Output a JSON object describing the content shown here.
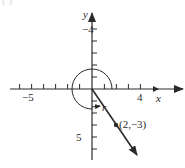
{
  "figure": {
    "top_fragment": "(      )",
    "axes": {
      "x_label": "x",
      "y_label": "y",
      "x_tick_labels": [
        {
          "value": -5,
          "text": "−5"
        },
        {
          "value": 4,
          "text": "4"
        }
      ],
      "y_tick_labels": [
        {
          "value": 5,
          "text": "5"
        },
        {
          "value": -4,
          "text": "−4"
        }
      ],
      "x_range": [
        -6,
        7
      ],
      "y_range": [
        -6,
        6
      ]
    },
    "point": {
      "x": 2,
      "y": -3,
      "label": "(2,−3)"
    },
    "angle_label": "r",
    "colors": {
      "ink": "#2a2a2a",
      "background": "#ffffff"
    }
  }
}
